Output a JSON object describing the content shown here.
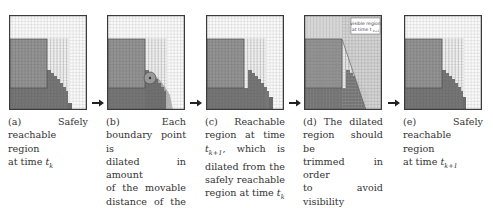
{
  "figure": {
    "panels": [
      {
        "id": "a",
        "type": "safely-reachable",
        "caption_lines": [
          "(a) Safely",
          "reachable region",
          "at time t_k"
        ],
        "caption_label": "(a)",
        "caption_text": "Safely reachable region at time",
        "caption_time": "t",
        "caption_sub": "k"
      },
      {
        "id": "b",
        "type": "dilation",
        "caption_label": "(b)",
        "caption_lines": [
          "(b) Each",
          "boundary point is",
          "dilated in amount",
          "of the movable",
          "distance of the",
          "robot in one time",
          "step"
        ]
      },
      {
        "id": "c",
        "type": "reachable-next",
        "caption_label": "(c)",
        "caption_lines": [
          "(c) Reachable",
          "region at time",
          "t_{k+1}, which is",
          "dilated from the",
          "safely reachable",
          "region at time t_k"
        ]
      },
      {
        "id": "d",
        "type": "trimmed",
        "caption_label": "(d)",
        "caption_lines": [
          "(d) The dilated",
          "region should be",
          "trimmed in order",
          "to avoid visibility",
          "from the observer"
        ],
        "annotation": {
          "line1": "visible region",
          "line2": "at time t",
          "sub": "k+1"
        }
      },
      {
        "id": "e",
        "type": "safely-reachable-next",
        "caption_label": "(e)",
        "caption_lines": [
          "(e) Safely",
          "reachable region",
          "at time t_{k+1}"
        ]
      }
    ],
    "arrows": [
      "a-to-b",
      "b-to-c",
      "c-to-d",
      "d-to-e"
    ],
    "colors": {
      "grid_bg": "#fafafa",
      "grid_line": "#c9c9c9",
      "obstacle": "#8a8a8a",
      "reachable": "#6b6b6b",
      "dilation": "#a8a8a8",
      "visible": "#d4d4d4",
      "frame": "#3a3a3a"
    }
  }
}
